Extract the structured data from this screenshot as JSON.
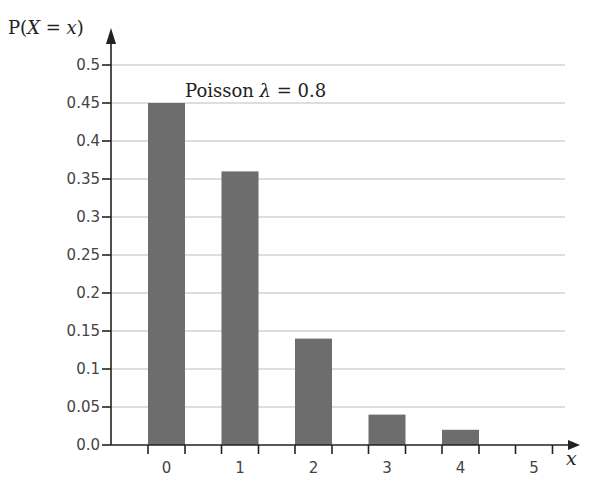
{
  "chart_data": {
    "type": "bar",
    "title": "",
    "annotation": "Poisson λ = 0.8",
    "xlabel": "x",
    "ylabel": "P(X = x)",
    "categories": [
      "0",
      "1",
      "2",
      "3",
      "4",
      "5"
    ],
    "values": [
      0.45,
      0.36,
      0.14,
      0.04,
      0.02,
      0.0
    ],
    "yticks": [
      "0.0",
      "0.05",
      "0.1",
      "0.15",
      "0.2",
      "0.25",
      "0.3",
      "0.35",
      "0.4",
      "0.45",
      "0.5"
    ],
    "ylim": [
      0,
      0.5
    ],
    "grid": true,
    "legend": "none",
    "bar_color": "#6d6d6d"
  }
}
